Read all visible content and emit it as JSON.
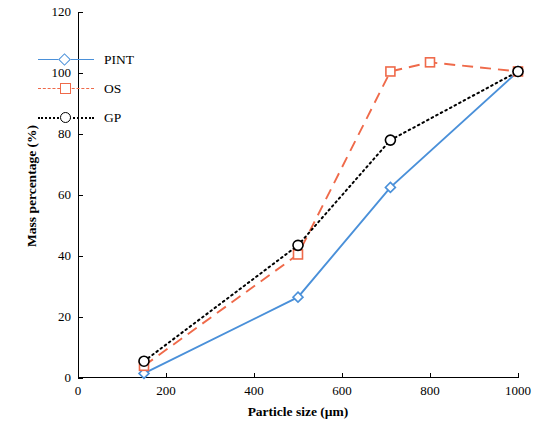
{
  "chart_data": {
    "type": "line",
    "title": "",
    "xlabel": "Particle size (µm)",
    "ylabel": "Mass percentage (%)",
    "xlim": [
      0,
      1000
    ],
    "ylim": [
      0,
      120
    ],
    "xticks": [
      0,
      200,
      400,
      600,
      800,
      1000
    ],
    "yticks": [
      0,
      20,
      40,
      60,
      80,
      100,
      120
    ],
    "grid": false,
    "legend_position": "upper-left",
    "series": [
      {
        "name": "PINT",
        "color": "#4a90d9",
        "linestyle": "solid",
        "marker": "diamond",
        "x": [
          150,
          500,
          710,
          1000
        ],
        "y": [
          1.5,
          26.5,
          62.5,
          100.5
        ]
      },
      {
        "name": "OS",
        "color": "#ef6a4a",
        "linestyle": "dashed",
        "marker": "square",
        "x": [
          150,
          500,
          710,
          800,
          1000
        ],
        "y": [
          4.0,
          40.5,
          100.5,
          103.5,
          100.5
        ]
      },
      {
        "name": "GP",
        "color": "#000000",
        "linestyle": "dotted",
        "marker": "circle",
        "x": [
          150,
          500,
          710,
          1000
        ],
        "y": [
          5.5,
          43.5,
          78.0,
          100.5
        ]
      }
    ]
  },
  "axis": {
    "xtick_labels": [
      "0",
      "200",
      "400",
      "600",
      "800",
      "1000"
    ],
    "ytick_labels": [
      "0",
      "20",
      "40",
      "60",
      "80",
      "100",
      "120"
    ],
    "x_title": "Particle size (µm)",
    "y_title": "Mass percentage (%)"
  },
  "legend": {
    "items": [
      {
        "label": "PINT"
      },
      {
        "label": "OS"
      },
      {
        "label": "GP"
      }
    ]
  }
}
